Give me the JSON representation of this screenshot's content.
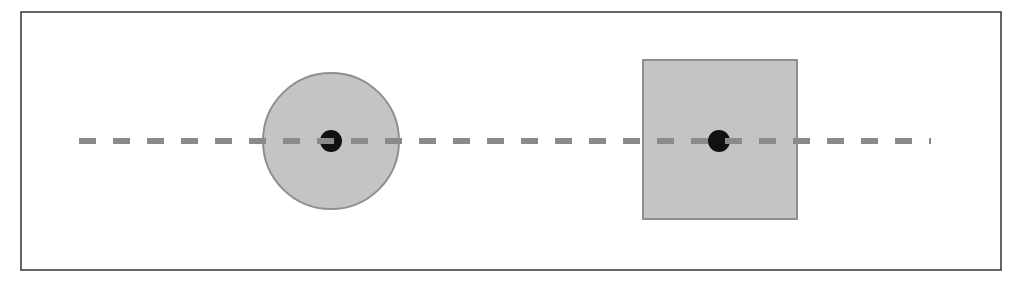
{
  "diagram": {
    "frame": {
      "x": 21,
      "y": 12,
      "width": 980,
      "height": 258,
      "stroke": "#333333"
    },
    "axis_line": {
      "x1": 79,
      "x2": 931,
      "y": 141,
      "stroke": "#8a8a8a",
      "width": 6,
      "dash": "17 17"
    },
    "shapes": [
      {
        "type": "circle",
        "name": "circle",
        "cx": 331,
        "cy": 141,
        "r": 68,
        "fill": "#c4c4c4",
        "stroke": "#8f8f8f"
      },
      {
        "type": "square",
        "name": "square",
        "x": 643,
        "y": 60,
        "width": 154,
        "height": 159,
        "fill": "#c4c4c4",
        "stroke": "#8f8f8f"
      }
    ],
    "center_points": [
      {
        "name": "circle-center",
        "cx": 331,
        "cy": 141,
        "r": 11,
        "fill": "#111111"
      },
      {
        "name": "square-center",
        "cx": 719,
        "cy": 141,
        "r": 11,
        "fill": "#111111"
      }
    ]
  }
}
